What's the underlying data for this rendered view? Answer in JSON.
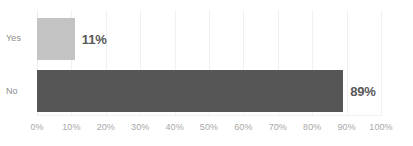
{
  "chart_data": {
    "type": "bar",
    "orientation": "horizontal",
    "title": "",
    "xlabel": "",
    "ylabel": "",
    "categories": [
      "Yes",
      "No"
    ],
    "values": [
      11,
      89
    ],
    "value_labels": [
      "11%",
      "89%"
    ],
    "xlim": [
      0,
      100
    ],
    "xticks": [
      0,
      10,
      20,
      30,
      40,
      50,
      60,
      70,
      80,
      90,
      100
    ],
    "xtick_labels": [
      "0%",
      "10%",
      "20%",
      "30%",
      "40%",
      "50%",
      "60%",
      "70%",
      "80%",
      "90%",
      "100%"
    ],
    "grid": true,
    "grid_axis": "x",
    "legend": false,
    "bar_colors": [
      "#c3c3c3",
      "#565656"
    ],
    "background_color": "#ffffff",
    "gridline_color": "#f0f0f0",
    "tick_label_color": "#a8a8a8",
    "category_label_color": "#8c8c8c",
    "value_label_color": "#585858"
  }
}
